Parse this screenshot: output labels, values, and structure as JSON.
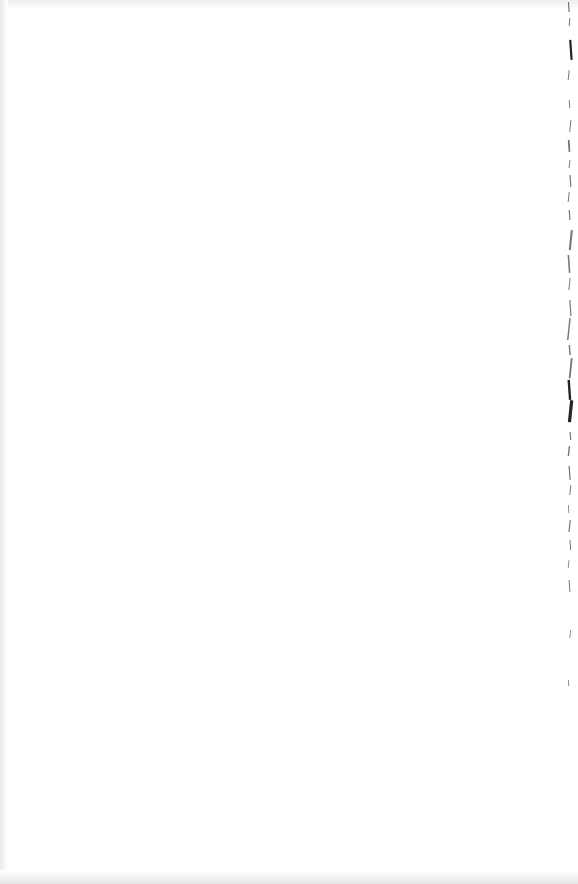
{
  "document": {
    "type": "blank scanned page",
    "text": "",
    "background_color": "#ffffff",
    "edge_mark_color": "#1a1a1a",
    "shade_color": "#e9e9e9"
  },
  "edge_marks": [
    {
      "y": 2,
      "h": 10,
      "w": 1.2
    },
    {
      "y": 18,
      "h": 8,
      "w": 1.0
    },
    {
      "y": 40,
      "h": 20,
      "w": 2.2
    },
    {
      "y": 70,
      "h": 10,
      "w": 1.0
    },
    {
      "y": 100,
      "h": 8,
      "w": 1.0
    },
    {
      "y": 120,
      "h": 12,
      "w": 1.0
    },
    {
      "y": 140,
      "h": 12,
      "w": 1.8
    },
    {
      "y": 160,
      "h": 8,
      "w": 1.0
    },
    {
      "y": 175,
      "h": 12,
      "w": 1.2
    },
    {
      "y": 192,
      "h": 10,
      "w": 1.0
    },
    {
      "y": 210,
      "h": 10,
      "w": 1.2
    },
    {
      "y": 230,
      "h": 20,
      "w": 2.0
    },
    {
      "y": 255,
      "h": 18,
      "w": 1.6
    },
    {
      "y": 278,
      "h": 12,
      "w": 1.0
    },
    {
      "y": 300,
      "h": 16,
      "w": 1.2
    },
    {
      "y": 318,
      "h": 22,
      "w": 1.4
    },
    {
      "y": 345,
      "h": 10,
      "w": 1.4
    },
    {
      "y": 358,
      "h": 20,
      "w": 1.8
    },
    {
      "y": 380,
      "h": 20,
      "w": 2.4
    },
    {
      "y": 400,
      "h": 22,
      "w": 3.2
    },
    {
      "y": 432,
      "h": 8,
      "w": 1.2
    },
    {
      "y": 446,
      "h": 10,
      "w": 1.4
    },
    {
      "y": 466,
      "h": 14,
      "w": 1.2
    },
    {
      "y": 485,
      "h": 10,
      "w": 1.0
    },
    {
      "y": 505,
      "h": 8,
      "w": 0.8
    },
    {
      "y": 520,
      "h": 12,
      "w": 1.2
    },
    {
      "y": 540,
      "h": 10,
      "w": 1.0
    },
    {
      "y": 560,
      "h": 8,
      "w": 0.8
    },
    {
      "y": 580,
      "h": 12,
      "w": 1.0
    },
    {
      "y": 630,
      "h": 8,
      "w": 0.8
    },
    {
      "y": 680,
      "h": 6,
      "w": 0.8
    }
  ]
}
